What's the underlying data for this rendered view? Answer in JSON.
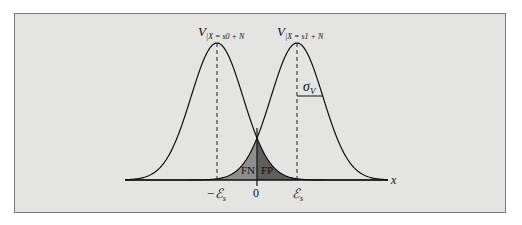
{
  "figure": {
    "type": "gaussian-decision-diagram",
    "background_color": "#e4e4e2",
    "border_color": "#7a7a7a",
    "curves": [
      {
        "id": "left",
        "label_main": "V",
        "label_sub": "|X = s0 + N",
        "mean_label": "−ℰ",
        "mean_sub": "s",
        "center_x": 217
      },
      {
        "id": "right",
        "label_main": "V",
        "label_sub": "|X = s1 + N",
        "mean_label": "ℰ",
        "mean_sub": "s",
        "center_x": 297
      }
    ],
    "threshold_label": "0",
    "axis_label": "x",
    "regions": [
      {
        "id": "fn",
        "label": "FN",
        "color": "#8e8e8e"
      },
      {
        "id": "fp",
        "label": "FP",
        "color": "#5e5e5e"
      }
    ],
    "sigma_label": "σ",
    "sigma_sub": "V"
  }
}
